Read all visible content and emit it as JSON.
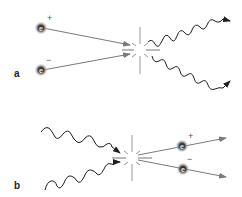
{
  "diagram": {
    "colors": {
      "line": "#7a7a7a",
      "wave": "#1e1e1e",
      "particle": "#3a3a3a",
      "glow": "#b0b0b0",
      "burst": "#9a9a9a"
    },
    "panels": [
      {
        "label": "a",
        "process": "electron-positron annihilation",
        "particles_in": [
          {
            "symbol": "e",
            "charge": "+"
          },
          {
            "symbol": "e",
            "charge": "−"
          }
        ],
        "out": [
          "photon",
          "photon"
        ]
      },
      {
        "label": "b",
        "process": "pair production",
        "in": [
          "photon",
          "photon"
        ],
        "particles_out": [
          {
            "symbol": "e",
            "charge": "+"
          },
          {
            "symbol": "e",
            "charge": "−"
          }
        ]
      }
    ]
  }
}
